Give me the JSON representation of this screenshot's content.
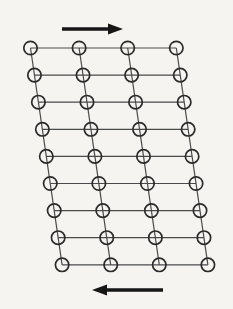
{
  "figure": {
    "type": "lattice-shear-diagram",
    "width": 233,
    "height": 309,
    "background": "#f5f4f1",
    "colors": {
      "grid_line": "#4a4a4a",
      "atom_outline": "#2b2b2b",
      "atom_fill": "none",
      "arrow": "#161616"
    }
  },
  "lattice": {
    "rows": 9,
    "cols": 4,
    "origin": {
      "x": 30.5,
      "y": 48
    },
    "row_spacing": 27.1,
    "col_spacing": 48.6,
    "shear_per_row": 3.95,
    "atom_radius": 6.7,
    "atom_stroke_width": 1.7,
    "line_stroke_width": 1.2
  },
  "arrows": [
    {
      "name": "top-shear-arrow",
      "direction": "right",
      "tail": {
        "x": 62,
        "y": 29
      },
      "tip": {
        "x": 123,
        "y": 29
      },
      "shaft_width": 3.4,
      "head_length": 15,
      "head_width": 11
    },
    {
      "name": "bottom-shear-arrow",
      "direction": "left",
      "tail": {
        "x": 163,
        "y": 290
      },
      "tip": {
        "x": 92,
        "y": 290
      },
      "shaft_width": 3.4,
      "head_length": 15,
      "head_width": 11
    }
  ]
}
